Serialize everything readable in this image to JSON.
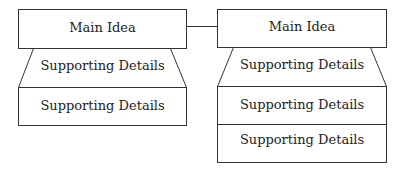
{
  "diagram": {
    "left": {
      "main_idea": "Main Idea",
      "details": [
        "Supporting Details",
        "Supporting Details"
      ]
    },
    "right": {
      "main_idea": "Main Idea",
      "details": [
        "Supporting Details",
        "Supporting Details",
        "Supporting Details"
      ]
    },
    "colors": {
      "stroke": "#333333",
      "background": "#ffffff",
      "text": "#222222"
    }
  }
}
